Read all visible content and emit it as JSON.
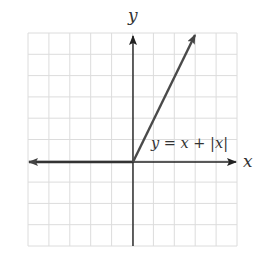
{
  "chart_data": {
    "type": "line",
    "title": "",
    "xlabel": "x",
    "ylabel": "y",
    "xlim": [
      -5,
      5
    ],
    "ylim": [
      -4,
      6
    ],
    "grid": true,
    "grid_step": 1,
    "tick_labels_shown": false,
    "series": [
      {
        "name": "y = x + |x|",
        "points": [
          [
            -5,
            0
          ],
          [
            0,
            0
          ],
          [
            3,
            6
          ]
        ],
        "color": "#4a4a4a",
        "arrow_left": true,
        "arrow_right": true
      }
    ],
    "annotations": [
      {
        "text": "y = x + |x|",
        "x": 0.9,
        "y": 0.7
      }
    ]
  },
  "labels": {
    "x_axis": "x",
    "y_axis": "y",
    "equation": "y = x + |x|"
  },
  "colors": {
    "grid": "#dcdcdc",
    "axis": "#333333",
    "curve": "#4a4a4a",
    "background": "#ffffff"
  }
}
